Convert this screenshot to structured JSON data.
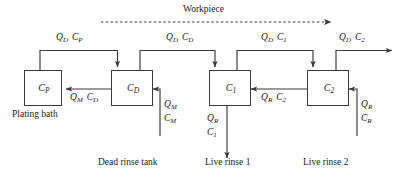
{
  "figure": {
    "type": "process-flow-diagram",
    "title_top": "Workpiece",
    "background_color": "#ffffff",
    "line_color": "#3a3a3a",
    "text_color": "#1a1a1a"
  },
  "tanks": [
    {
      "id": "plating-bath",
      "symbol": "C",
      "subscript": "P",
      "caption": "Plating bath"
    },
    {
      "id": "dead-rinse-tank",
      "symbol": "C",
      "subscript": "D",
      "caption": "Dead rinse tank"
    },
    {
      "id": "live-rinse-1",
      "symbol": "C",
      "subscript": "1",
      "caption": "Live rinse  1"
    },
    {
      "id": "live-rinse-2",
      "symbol": "C",
      "subscript": "2",
      "caption": "Live rinse  2"
    }
  ],
  "top_flows": [
    {
      "id": "drag-out-plating",
      "flow": "Q",
      "flow_sub": "D",
      "conc": "C",
      "conc_sub": "P"
    },
    {
      "id": "drag-out-dead",
      "flow": "Q",
      "flow_sub": "D",
      "conc": "C",
      "conc_sub": "D"
    },
    {
      "id": "drag-out-rinse1",
      "flow": "Q",
      "flow_sub": "D",
      "conc": "C",
      "conc_sub": "1"
    },
    {
      "id": "drag-out-rinse2",
      "flow": "Q",
      "flow_sub": "D",
      "conc": "C",
      "conc_sub": "2"
    }
  ],
  "bottom_flows": [
    {
      "id": "makeup-return",
      "flow": "Q",
      "flow_sub": "M",
      "conc": "C",
      "conc_sub": "D"
    },
    {
      "id": "rinse-return",
      "flow": "Q",
      "flow_sub": "R",
      "conc": "C",
      "conc_sub": "2"
    }
  ],
  "vertical_flows": [
    {
      "id": "makeup-feed",
      "flow": "Q",
      "flow_sub": "M",
      "conc": "C",
      "conc_sub": "M"
    },
    {
      "id": "rinse-discharge",
      "flow": "Q",
      "flow_sub": "R",
      "conc": "C",
      "conc_sub": "1"
    },
    {
      "id": "rinse-water-feed",
      "flow": "Q",
      "flow_sub": "R",
      "conc": "C",
      "conc_sub": "R"
    }
  ]
}
